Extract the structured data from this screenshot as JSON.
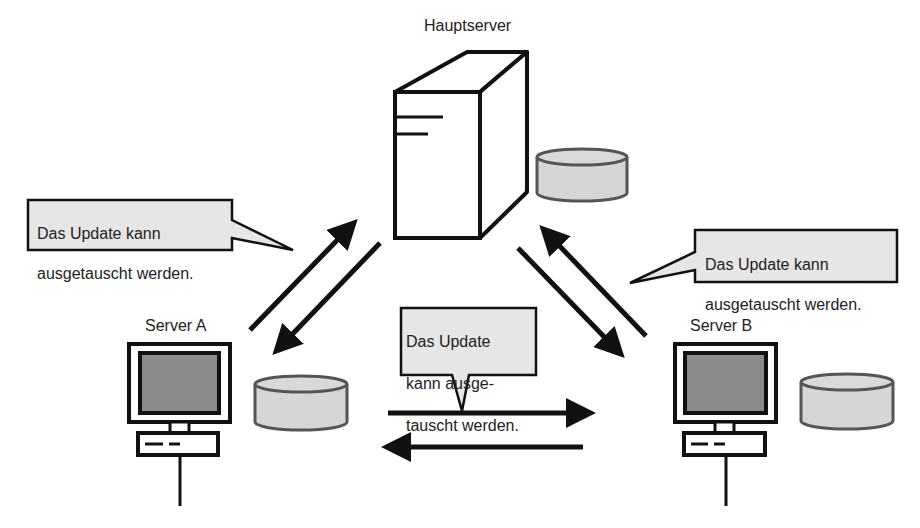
{
  "main_server": {
    "label": "Hauptserver",
    "icon": "tower-server-icon"
  },
  "server_a": {
    "label": "Server A",
    "icon": "desktop-computer-icon",
    "storage_icon": "database-cylinder-icon"
  },
  "server_b": {
    "label": "Server B",
    "icon": "desktop-computer-icon",
    "storage_icon": "database-cylinder-icon"
  },
  "callouts": {
    "left": {
      "line1": "Das Update kann",
      "line2": "ausgetauscht werden."
    },
    "right": {
      "line1": "Das Update kann",
      "line2": "ausgetauscht werden."
    },
    "center": {
      "line1": "Das Update",
      "line2": "kann ausge-",
      "line3": "tauscht werden."
    }
  },
  "connections": [
    {
      "from": "Server A",
      "to": "Hauptserver"
    },
    {
      "from": "Hauptserver",
      "to": "Server A"
    },
    {
      "from": "Hauptserver",
      "to": "Server B"
    },
    {
      "from": "Server B",
      "to": "Hauptserver"
    },
    {
      "from": "Server A",
      "to": "Server B"
    },
    {
      "from": "Server B",
      "to": "Server A"
    }
  ],
  "colors": {
    "stroke": "#111111",
    "screen": "#8a8a8a",
    "cylinder_fill": "#d6d6d6",
    "cylinder_stroke": "#555555",
    "callout_fill": "#e6e6e6"
  }
}
